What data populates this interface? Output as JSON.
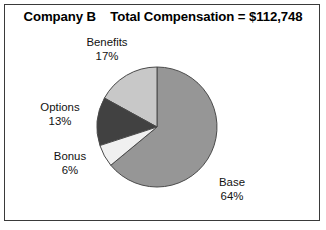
{
  "chart_data": {
    "type": "pie",
    "title": "Company B    Total Compensation = $112,748",
    "company": "Company B",
    "total_label": "Total Compensation = $112,748",
    "total_value": 112748,
    "categories": [
      "Base",
      "Benefits",
      "Options",
      "Bonus"
    ],
    "values": [
      64,
      17,
      13,
      6
    ],
    "value_suffix": "%",
    "labels": [
      {
        "name": "Benefits",
        "value": "17%",
        "pct": 17,
        "color": "#c8c8c8"
      },
      {
        "name": "Options",
        "value": "13%",
        "pct": 13,
        "color": "#414141"
      },
      {
        "name": "Bonus",
        "value": "6%",
        "pct": 6,
        "color": "#f0f0f0"
      },
      {
        "name": "Base",
        "value": "64%",
        "pct": 64,
        "color": "#969696"
      }
    ],
    "start_angle_deg": 90,
    "direction": "counterclockwise",
    "legend": "none",
    "grid": false,
    "colors": {
      "base": "#969696",
      "benefits": "#c8c8c8",
      "options": "#414141",
      "bonus": "#f0f0f0",
      "slice_outline": "#4a4a4a",
      "frame": "#3a3a3a",
      "background": "#ffffff",
      "text": "#111111",
      "title_text": "#000000"
    }
  },
  "figure": {
    "title": "Company B    Total Compensation = $112,748",
    "benefits_name": "Benefits",
    "benefits_value": "17%",
    "options_name": "Options",
    "options_value": "13%",
    "bonus_name": "Bonus",
    "bonus_value": "6%",
    "base_name": "Base",
    "base_value": "64%"
  }
}
